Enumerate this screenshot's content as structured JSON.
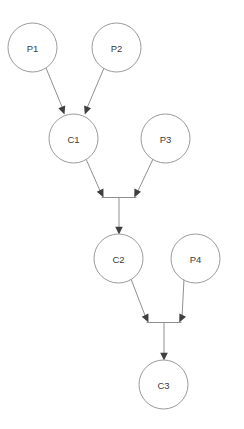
{
  "canvas": {
    "width": 244,
    "height": 429,
    "background": "#ffffff"
  },
  "style": {
    "node_stroke": "#9a9a9a",
    "node_fill": "#ffffff",
    "edge_stroke": "#8f8f8f",
    "arrow_fill": "#3f3f3f",
    "label_color": "#3b3b3b",
    "node_radius": 24.5
  },
  "diagram": {
    "type": "flow-graph",
    "title": "",
    "nodes": [
      {
        "id": "P1",
        "label": "P1",
        "cx": 32.5,
        "cy": 47.5,
        "r": 24.5,
        "kind": "parent"
      },
      {
        "id": "P2",
        "label": "P2",
        "cx": 116.5,
        "cy": 47.5,
        "r": 24.5,
        "kind": "parent"
      },
      {
        "id": "C1",
        "label": "C1",
        "cx": 73.5,
        "cy": 138.5,
        "r": 24.5,
        "kind": "child"
      },
      {
        "id": "P3",
        "label": "P3",
        "cx": 165.5,
        "cy": 138.5,
        "r": 24.5,
        "kind": "parent"
      },
      {
        "id": "C2",
        "label": "C2",
        "cx": 118.5,
        "cy": 258.5,
        "r": 24.5,
        "kind": "child"
      },
      {
        "id": "P4",
        "label": "P4",
        "cx": 195.5,
        "cy": 258.5,
        "r": 24.5,
        "kind": "parent"
      },
      {
        "id": "C3",
        "label": "C3",
        "cx": 163.5,
        "cy": 384.5,
        "r": 24.5,
        "kind": "child"
      }
    ],
    "junctions": [
      {
        "id": "J1",
        "x_left": 101,
        "x_right": 137,
        "y": 197,
        "cx": 119,
        "y_out": 231
      },
      {
        "id": "J2",
        "x_left": 146,
        "x_right": 182,
        "y": 322,
        "cx": 164,
        "y_out": 357
      }
    ],
    "edges": [
      {
        "from": "P1",
        "to": "C1",
        "arrow": true
      },
      {
        "from": "P2",
        "to": "C1",
        "arrow": true
      },
      {
        "from": "C1",
        "to": "J1",
        "arrow": true
      },
      {
        "from": "P3",
        "to": "J1",
        "arrow": true
      },
      {
        "from": "J1",
        "to": "C2",
        "arrow": true
      },
      {
        "from": "C2",
        "to": "J2",
        "arrow": true
      },
      {
        "from": "P4",
        "to": "J2",
        "arrow": true
      },
      {
        "from": "J2",
        "to": "C3",
        "arrow": true
      }
    ]
  }
}
